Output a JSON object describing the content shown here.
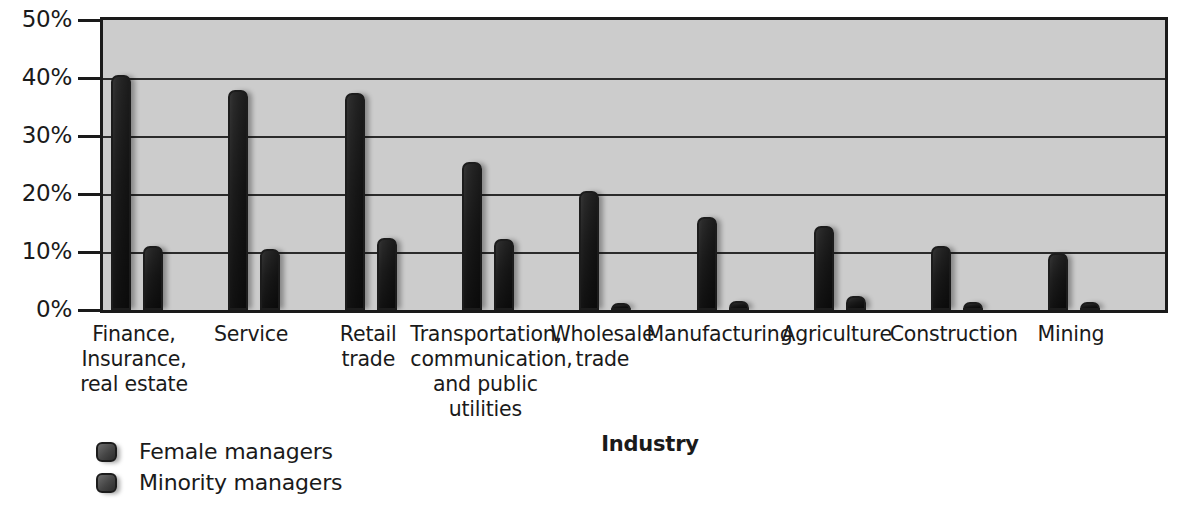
{
  "chart_data": {
    "type": "bar",
    "title": "",
    "xlabel": "Industry",
    "ylabel": "",
    "ylim": [
      0,
      50
    ],
    "ytick_labels": [
      "50%",
      "40%",
      "30%",
      "20%",
      "10%",
      "0%"
    ],
    "yticks": [
      50,
      40,
      30,
      20,
      10,
      0
    ],
    "grid": true,
    "legend_position": "bottom-left",
    "categories": [
      "Finance,\nInsurance,\nreal estate",
      "Service",
      "Retail\ntrade",
      "Transportation,\ncommunication,\nand public\nutilities",
      "Wholesale\ntrade",
      "Manufacturing",
      "Agriculture",
      "Construction",
      "Mining"
    ],
    "series": [
      {
        "name": "Female managers",
        "values": [
          40.5,
          38.0,
          37.5,
          25.5,
          20.5,
          16.0,
          14.5,
          11.0,
          9.8
        ]
      },
      {
        "name": "Minority managers",
        "values": [
          11.0,
          10.5,
          12.5,
          12.3,
          1.2,
          1.5,
          2.5,
          1.3,
          1.3
        ]
      }
    ]
  },
  "legend": {
    "items": [
      {
        "label": "Female managers"
      },
      {
        "label": "Minority managers"
      }
    ]
  },
  "colors": {
    "plot_background": "#cccccc",
    "page_background": "#ffffff",
    "axis": "#1a1a1a",
    "gridline": "#2b2b2b",
    "bar_dark": "#2e2e2e",
    "bar_light": "#7a7a7a"
  }
}
